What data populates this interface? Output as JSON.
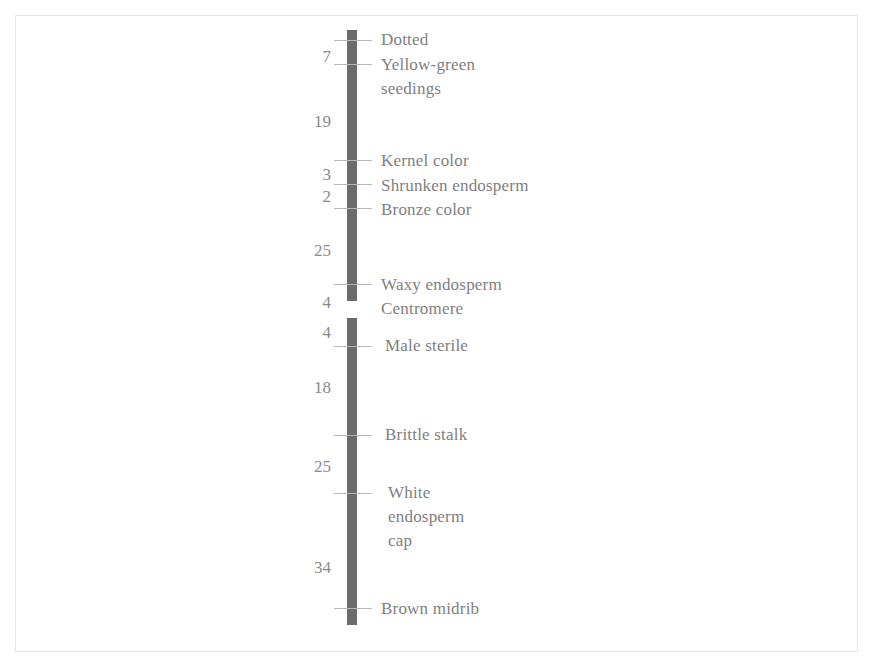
{
  "diagram": {
    "type": "genetic-linkage-map",
    "bar_color": "#6b6b6b",
    "text_color": "#808080",
    "segments": [
      {
        "name": "upper-arm",
        "top": 30,
        "bottom": 301
      },
      {
        "name": "lower-arm",
        "top": 318,
        "bottom": 625
      }
    ],
    "genes": [
      {
        "label": "Dotted",
        "tick_y": 40,
        "label_y": 28
      },
      {
        "label": "Yellow-green\nseedings",
        "tick_y": 64,
        "label_y": 53
      },
      {
        "label": "Kernel color",
        "tick_y": 160,
        "label_y": 149
      },
      {
        "label": "Shrunken endosperm",
        "tick_y": 184,
        "label_y": 174
      },
      {
        "label": "Bronze color",
        "tick_y": 208,
        "label_y": 198
      },
      {
        "label": "Waxy endosperm",
        "tick_y": 284,
        "label_y": 273
      },
      {
        "label": "Centromere",
        "tick_y": null,
        "label_y": 297
      },
      {
        "label": "Male sterile",
        "tick_y": 346,
        "label_y": 334
      },
      {
        "label": "Brittle stalk",
        "tick_y": 435,
        "label_y": 423
      },
      {
        "label": "White\nendosperm\ncap",
        "tick_y": 493,
        "label_y": 481
      },
      {
        "label": "Brown midrib",
        "tick_y": 608,
        "label_y": 597
      }
    ],
    "distances": [
      {
        "value": "7",
        "y": 47
      },
      {
        "value": "19",
        "y": 112
      },
      {
        "value": "3",
        "y": 165
      },
      {
        "value": "2",
        "y": 187
      },
      {
        "value": "25",
        "y": 241
      },
      {
        "value": "4",
        "y": 293
      },
      {
        "value": "4",
        "y": 323
      },
      {
        "value": "18",
        "y": 378
      },
      {
        "value": "25",
        "y": 457
      },
      {
        "value": "34",
        "y": 558
      }
    ]
  }
}
